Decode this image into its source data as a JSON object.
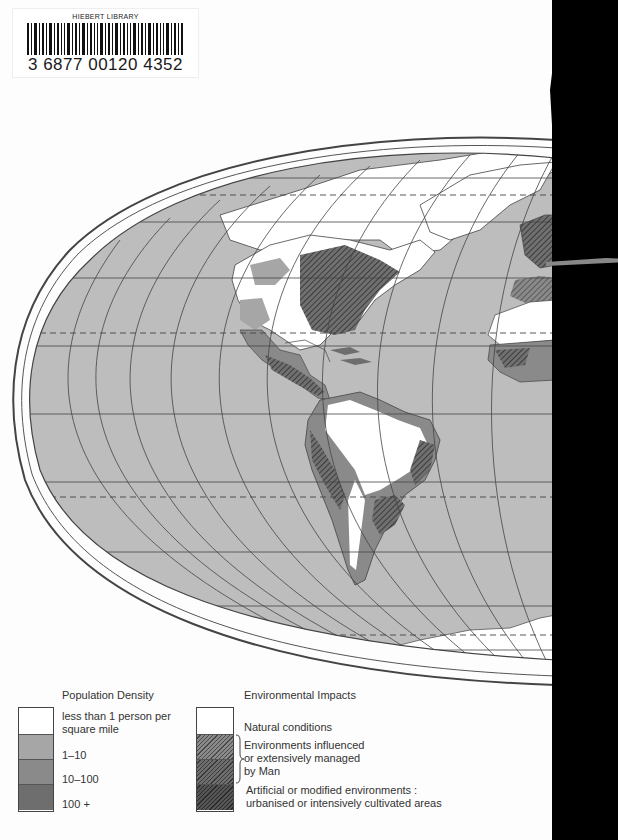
{
  "barcode": {
    "library_name": "HIEBERT LIBRARY",
    "number": "3 6877 00120 4352"
  },
  "map": {
    "description": "World map (western hemisphere shown) – population density and environmental impacts",
    "colors": {
      "ocean": "#bdbdbd",
      "natural": "#ffffff",
      "density_1_10": "#a6a6a6",
      "density_10_100": "#8a8a8a",
      "density_100_plus": "#6e6e6e",
      "hatch": "#3a3a3a",
      "grid": "#444444"
    }
  },
  "legend": {
    "population": {
      "title": "Population Density",
      "items": [
        {
          "label_line1": "less than 1 person per",
          "label_line2": "square mile",
          "color": "#ffffff"
        },
        {
          "label_line1": "1–10",
          "color": "#a6a6a6"
        },
        {
          "label_line1": "10–100",
          "color": "#8a8a8a"
        },
        {
          "label_line1": "100 +",
          "color": "#6e6e6e"
        }
      ]
    },
    "environment": {
      "title": "Environmental Impacts",
      "items": [
        {
          "label": "Natural conditions"
        },
        {
          "label_line1": "Environments influenced",
          "label_line2": "or extensively managed",
          "label_line3": "by Man"
        },
        {
          "label_line1": "Artificial or modified environments :",
          "label_line2": "urbanised or intensively cultivated areas"
        }
      ]
    }
  }
}
